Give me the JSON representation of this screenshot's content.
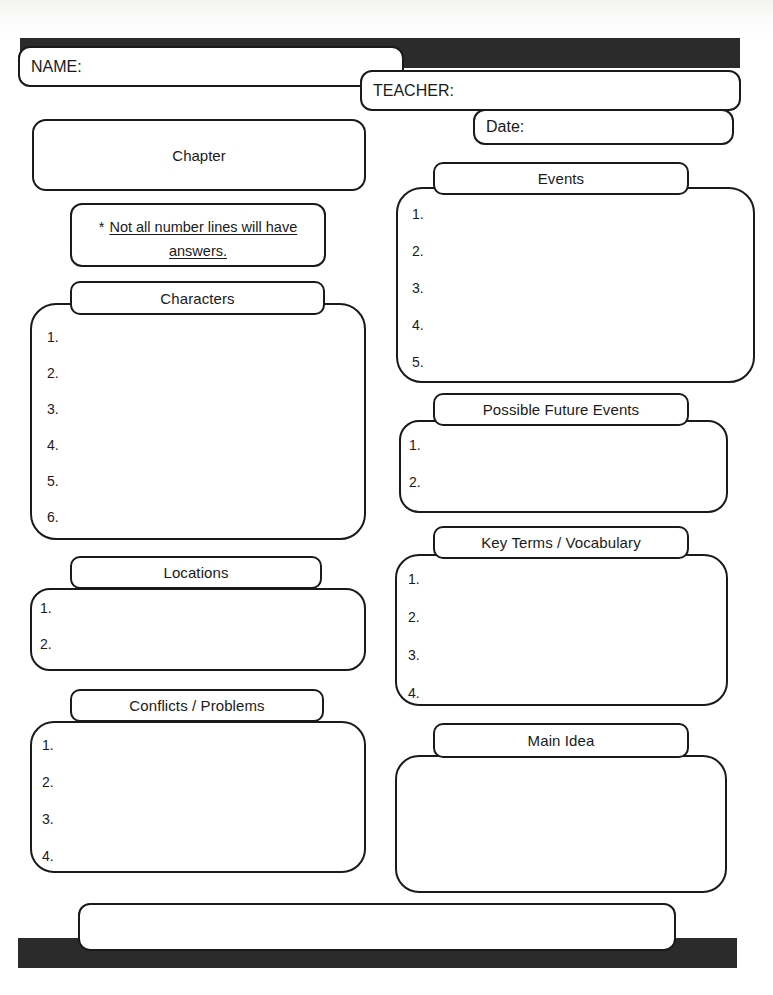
{
  "document": {
    "title": "Chapter Notes Graphic Organizer",
    "ink_color": "#1a1a1a",
    "bar_color": "#2b2b2b",
    "paper_color": "#ffffff"
  },
  "header": {
    "name_label": "NAME:",
    "teacher_label": "TEACHER:",
    "date_label": "Date:"
  },
  "left_column": {
    "chapter": {
      "label": "Chapter"
    },
    "note": {
      "star": "*",
      "underlined_line_1": "Not all number lines will have",
      "underlined_line_2": "answers."
    },
    "characters": {
      "label": "Characters",
      "lines": [
        "1.",
        "2.",
        "3.",
        "4.",
        "5.",
        "6."
      ]
    },
    "locations": {
      "label": "Locations",
      "lines": [
        "1.",
        "2."
      ]
    },
    "conflicts": {
      "label": "Conflicts / Problems",
      "lines": [
        "1.",
        "2.",
        "3.",
        "4."
      ]
    }
  },
  "right_column": {
    "events": {
      "label": "Events",
      "lines": [
        "1.",
        "2.",
        "3.",
        "4.",
        "5."
      ]
    },
    "future_events": {
      "label": "Possible Future Events",
      "lines": [
        "1.",
        "2."
      ]
    },
    "key_terms": {
      "label": "Key Terms / Vocabulary",
      "lines": [
        "1.",
        "2.",
        "3.",
        "4."
      ]
    },
    "main_idea": {
      "label": "Main Idea",
      "lines": []
    }
  },
  "footer": {
    "note_box": ""
  }
}
